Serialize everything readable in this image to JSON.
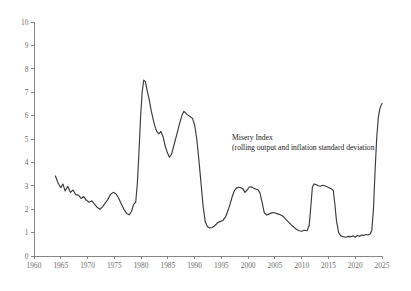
{
  "chart_data": {
    "type": "line",
    "title": "",
    "xlabel": "",
    "ylabel": "",
    "xlim": [
      1960,
      2025
    ],
    "ylim": [
      0,
      10
    ],
    "grid": false,
    "legend": "none",
    "annotations": [
      {
        "name": "series-annotation",
        "line1": "Misery Index",
        "line2": "(rolling output and inflation standard deviation",
        "x": 1997,
        "y": 4.95
      }
    ],
    "xticks": [
      1960,
      1965,
      1970,
      1975,
      1980,
      1985,
      1990,
      1995,
      2000,
      2005,
      2010,
      2015,
      2020,
      2025
    ],
    "xtick_labels": [
      "1960",
      "1965",
      "1970",
      "1975",
      "1980",
      "1985",
      "1990",
      "1995",
      "2000",
      "2005",
      "2010",
      "2015",
      "2020",
      "2025"
    ],
    "yticks": [
      0,
      1,
      2,
      3,
      4,
      5,
      6,
      7,
      8,
      9,
      10
    ],
    "ytick_labels": [
      "0",
      "1",
      "2",
      "3",
      "4",
      "5",
      "6",
      "7",
      "8",
      "9",
      "10"
    ],
    "line_color": "#3a3a3a",
    "axis_color": "#7a7a7a",
    "series": [
      {
        "name": "Misery Index",
        "x": [
          1964.0,
          1964.5,
          1965.0,
          1965.4,
          1965.8,
          1966.3,
          1966.8,
          1967.3,
          1967.8,
          1968.3,
          1968.8,
          1969.3,
          1969.8,
          1970.3,
          1970.8,
          1971.3,
          1971.8,
          1972.3,
          1972.8,
          1973.3,
          1973.8,
          1974.3,
          1974.8,
          1975.3,
          1975.8,
          1976.3,
          1976.8,
          1977.3,
          1977.8,
          1978.2,
          1978.6,
          1979.0,
          1979.3,
          1979.6,
          1979.9,
          1980.2,
          1980.5,
          1980.8,
          1981.1,
          1981.5,
          1981.9,
          1982.3,
          1982.7,
          1983.0,
          1983.3,
          1983.7,
          1984.1,
          1984.5,
          1984.9,
          1985.3,
          1985.7,
          1986.1,
          1986.5,
          1986.9,
          1987.3,
          1987.7,
          1988.0,
          1988.3,
          1988.6,
          1988.9,
          1989.2,
          1989.6,
          1990.0,
          1990.4,
          1990.8,
          1991.2,
          1991.6,
          1992.0,
          1992.4,
          1992.8,
          1993.3,
          1993.8,
          1994.3,
          1994.8,
          1995.3,
          1995.8,
          1996.2,
          1996.6,
          1997.0,
          1997.4,
          1997.8,
          1998.2,
          1998.6,
          1999.0,
          1999.4,
          1999.8,
          2000.2,
          2000.6,
          2001.0,
          2001.4,
          2001.8,
          2002.2,
          2002.6,
          2003.0,
          2003.5,
          2004.0,
          2004.5,
          2005.0,
          2005.5,
          2006.0,
          2006.5,
          2007.0,
          2007.5,
          2008.0,
          2008.5,
          2009.0,
          2009.5,
          2010.0,
          2010.5,
          2011.0,
          2011.4,
          2011.7,
          2012.0,
          2012.3,
          2012.7,
          2013.1,
          2013.5,
          2013.9,
          2014.3,
          2014.7,
          2015.1,
          2015.5,
          2015.9,
          2016.2,
          2016.5,
          2016.9,
          2017.3,
          2017.8,
          2018.3,
          2018.8,
          2019.2,
          2019.6,
          2020.0,
          2020.4,
          2020.8,
          2021.2,
          2021.6,
          2022.0,
          2022.4,
          2022.8,
          2023.1,
          2023.4,
          2023.7,
          2024.0,
          2024.3,
          2024.6,
          2024.9,
          2025.0
        ],
        "y": [
          3.42,
          3.12,
          2.92,
          3.08,
          2.78,
          2.98,
          2.72,
          2.82,
          2.62,
          2.6,
          2.46,
          2.54,
          2.38,
          2.3,
          2.36,
          2.22,
          2.08,
          2.0,
          2.1,
          2.26,
          2.42,
          2.64,
          2.72,
          2.66,
          2.48,
          2.22,
          2.0,
          1.82,
          1.76,
          1.9,
          2.2,
          2.3,
          3.1,
          4.4,
          5.9,
          7.0,
          7.52,
          7.45,
          7.1,
          6.7,
          6.2,
          5.8,
          5.45,
          5.3,
          5.22,
          5.32,
          5.1,
          4.7,
          4.42,
          4.22,
          4.35,
          4.7,
          5.05,
          5.4,
          5.75,
          6.05,
          6.18,
          6.12,
          6.05,
          6.0,
          5.95,
          5.88,
          5.6,
          5.0,
          4.1,
          3.1,
          2.1,
          1.45,
          1.25,
          1.2,
          1.22,
          1.3,
          1.42,
          1.48,
          1.52,
          1.68,
          1.92,
          2.2,
          2.52,
          2.78,
          2.9,
          2.94,
          2.92,
          2.88,
          2.72,
          2.82,
          2.95,
          2.96,
          2.9,
          2.86,
          2.84,
          2.7,
          2.3,
          1.85,
          1.75,
          1.8,
          1.86,
          1.84,
          1.8,
          1.76,
          1.7,
          1.58,
          1.46,
          1.34,
          1.24,
          1.14,
          1.08,
          1.06,
          1.1,
          1.08,
          1.3,
          2.1,
          2.95,
          3.08,
          3.05,
          3.0,
          2.98,
          3.02,
          3.0,
          2.96,
          2.92,
          2.88,
          2.8,
          2.2,
          1.5,
          1.0,
          0.86,
          0.82,
          0.8,
          0.84,
          0.82,
          0.86,
          0.8,
          0.88,
          0.84,
          0.9,
          0.88,
          0.92,
          0.9,
          0.94,
          1.1,
          2.0,
          3.6,
          5.0,
          5.9,
          6.3,
          6.48,
          6.52
        ]
      }
    ]
  }
}
